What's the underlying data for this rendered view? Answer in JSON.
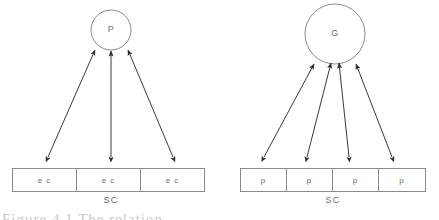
{
  "figure": {
    "background_color": "#ffffff",
    "stroke_color": "#8a8a8a",
    "arrow_color": "#3a3a3a",
    "text_color": "#6d6d6d",
    "caption_partial": "Figure 4.1  The relation",
    "panels": [
      {
        "id": "left",
        "node": {
          "label": "P",
          "shape": "circle",
          "cx": 111,
          "cy": 30,
          "r": 20
        },
        "group_label": "SC",
        "cells": [
          {
            "label": "e c"
          },
          {
            "label": "e c"
          },
          {
            "label": "e c"
          }
        ],
        "box": {
          "x": 12,
          "y": 168,
          "width": 193,
          "height": 24
        },
        "arrows": [
          {
            "x1": 48,
            "y1": 157,
            "x2": 95,
            "y2": 50,
            "double": true
          },
          {
            "x1": 111,
            "y1": 157,
            "x2": 111,
            "y2": 51,
            "double": true
          },
          {
            "x1": 173,
            "y1": 157,
            "x2": 128,
            "y2": 50,
            "double": true
          }
        ]
      },
      {
        "id": "right",
        "node": {
          "label": "G",
          "shape": "circle",
          "cx": 335,
          "cy": 34,
          "r": 30
        },
        "group_label": "SC",
        "cells": [
          {
            "label": "p"
          },
          {
            "label": "p"
          },
          {
            "label": "p"
          },
          {
            "label": "p"
          }
        ],
        "box": {
          "x": 240,
          "y": 168,
          "width": 186,
          "height": 24
        },
        "arrows": [
          {
            "x1": 264,
            "y1": 157,
            "x2": 314,
            "y2": 64,
            "double": true
          },
          {
            "x1": 307,
            "y1": 157,
            "x2": 331,
            "y2": 63,
            "double": true
          },
          {
            "x1": 349,
            "y1": 157,
            "x2": 339,
            "y2": 63,
            "double": true
          },
          {
            "x1": 392,
            "y1": 157,
            "x2": 356,
            "y2": 64,
            "double": true
          }
        ]
      }
    ]
  }
}
